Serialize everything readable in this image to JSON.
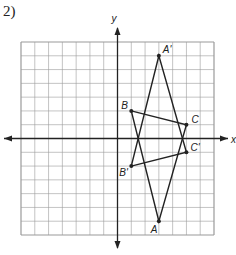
{
  "problem": {
    "number": "2)"
  },
  "graph": {
    "x_axis_label": "x",
    "y_axis_label": "y",
    "range": {
      "xmin": -7,
      "xmax": 7,
      "ymin": -7,
      "ymax": 7
    },
    "grid_color": "#9a9a9a",
    "line_color": "#222222"
  },
  "triangles": [
    {
      "name": "ABC",
      "points": [
        {
          "label": "A",
          "x": 3,
          "y": -6
        },
        {
          "label": "B",
          "x": 1,
          "y": 2
        },
        {
          "label": "C",
          "x": 5,
          "y": 1
        }
      ]
    },
    {
      "name": "A'B'C'",
      "points": [
        {
          "label": "A'",
          "x": 3,
          "y": 6
        },
        {
          "label": "B'",
          "x": 1,
          "y": -2
        },
        {
          "label": "C'",
          "x": 5,
          "y": -1
        }
      ]
    }
  ]
}
